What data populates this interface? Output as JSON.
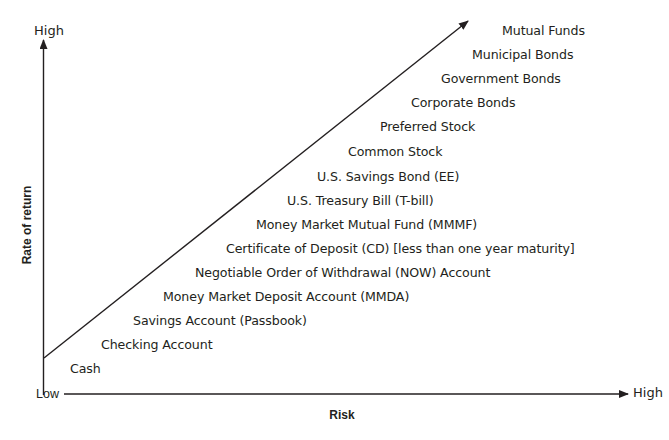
{
  "diagram": {
    "type": "risk-return-spectrum",
    "y_axis": {
      "title": "Rate of return",
      "low_label": "Low",
      "high_label": "High"
    },
    "x_axis": {
      "title": "Risk",
      "high_label": "High"
    },
    "items": [
      {
        "label": "Mutual Funds",
        "x": 502,
        "y": 31
      },
      {
        "label": "Municipal Bonds",
        "x": 472,
        "y": 55
      },
      {
        "label": "Government Bonds",
        "x": 441,
        "y": 79
      },
      {
        "label": "Corporate Bonds",
        "x": 411,
        "y": 103
      },
      {
        "label": "Preferred Stock",
        "x": 380,
        "y": 127
      },
      {
        "label": "Common Stock",
        "x": 348,
        "y": 152
      },
      {
        "label": "U.S. Savings Bond (EE)",
        "x": 317,
        "y": 177
      },
      {
        "label": "U.S. Treasury Bill (T-bill)",
        "x": 287,
        "y": 201
      },
      {
        "label": "Money Market Mutual Fund (MMMF)",
        "x": 256,
        "y": 225
      },
      {
        "label": "Certificate of Deposit (CD) [less than one year maturity]",
        "x": 226,
        "y": 249
      },
      {
        "label": "Negotiable Order of Withdrawal (NOW) Account",
        "x": 195,
        "y": 273
      },
      {
        "label": "Money Market Deposit Account (MMDA)",
        "x": 163,
        "y": 297
      },
      {
        "label": "Savings Account (Passbook)",
        "x": 133,
        "y": 321
      },
      {
        "label": "Checking Account",
        "x": 101,
        "y": 345
      },
      {
        "label": "Cash",
        "x": 70,
        "y": 369
      }
    ],
    "colors": {
      "ink": "#231f20",
      "background": "#ffffff"
    }
  }
}
